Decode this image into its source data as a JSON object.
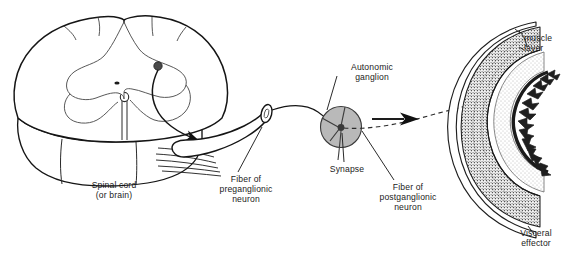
{
  "figure": {
    "background_color": "#ffffff",
    "ink_color": "#1a1a1a"
  },
  "labels": {
    "spinal_cord": "Spinal cord\n(or brain)",
    "preganglionic_fiber": "Fiber of\npreganglionic\nneuron",
    "autonomic_ganglion": "Autonomic\nganglion",
    "synapse": "Synapse",
    "postganglionic_fiber": "Fiber of\npostganglionic\nneuron",
    "muscle_layer": "muscle\nlayer",
    "visceral_effector": "Visceral\neffector"
  },
  "structures": {
    "spinal_cord": {
      "name": "spinal-cord-cross-section",
      "description": "Three-dimensional block of spinal cord with butterfly-shaped gray matter on cut face",
      "features": [
        "gray matter horns",
        "central canal",
        "ventral root rootlets",
        "preganglionic neuron cell body"
      ]
    },
    "ganglion": {
      "name": "autonomic-ganglion",
      "fill_color": "#b9b9b9",
      "outline_color": "#3a3a3a",
      "cell_body_color": "#4a4a4a",
      "description": "Gray sphere containing postganglionic neuron cell body where synapse occurs"
    },
    "visceral_effector": {
      "name": "visceral-effector-organ",
      "description": "Cross-section of hollow visceral organ showing concentric wall layers",
      "layers": [
        "serosa",
        "longitudinal muscle layer",
        "circular muscle layer",
        "submucosa",
        "mucosa with villi"
      ]
    },
    "fibers": {
      "preganglionic": {
        "style": "solid",
        "description": "Myelinated axon leaving spinal cord via ventral root to ganglion"
      },
      "postganglionic": {
        "style": "dashed",
        "description": "Unmyelinated axon from ganglion to visceral effector",
        "arrowhead": true
      }
    }
  }
}
